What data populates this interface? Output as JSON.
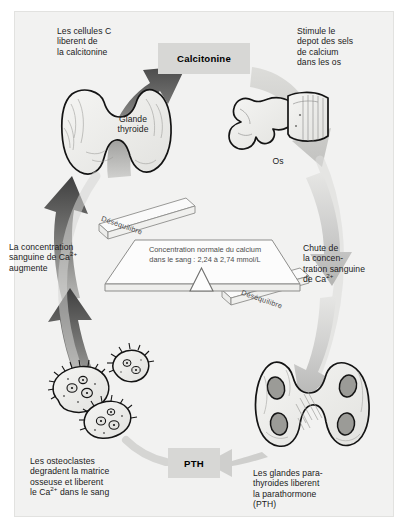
{
  "figure": {
    "background_color": "#f2f2f1",
    "page_color": "#ffffff",
    "accent_box_color": "#d7d7d5",
    "dark_arrow_color": "#4f4f4f",
    "light_arrow_color": "#c9c9c7",
    "organ_fill_color": "#efefed",
    "organ_outline_color": "#1a1a1a"
  },
  "labels": {
    "cellules_c": "Les cellules C\nliberent de\nla calcitonine",
    "cellules_c_display": "Les cellules C libèrent de la calcitonine",
    "stimule": "Stimule le\ndepot des sels\nde calcium\ndans les os",
    "stimule_display": "Stimule le dépôt des sels de calcium dans les os",
    "glande_thyroide": "Glande\nthyroide",
    "glande_thyroide_display": "Glande thyroïde",
    "os": "Os",
    "concentration_augmente": "La concentration\nsanguine de Ca",
    "concentration_augmente_tail": "\naugmente",
    "concentration_augmente_display": "La concentration sanguine de Ca2+ augmente",
    "chute": "Chute de\nla concen-\ntration sanguine\nde Ca",
    "chute_display": "Chute de la concentration sanguine de Ca2+",
    "osteoclastes": "Les osteoclastes\ndegradent la matrice\nosseuse et liberent\nle Ca",
    "osteoclastes_tail": " dans le sang",
    "osteoclastes_display": "Les ostéoclastes dégradent la matrice osseuse et libèrent le Ca2+ dans le sang",
    "parathyroides": "Les glandes para-\nthyroides liberent\nla parathormone\n(PTH)",
    "parathyroides_display": "Les glandes parathyroïdes libèrent la parathormone (PTH)",
    "ion_charge": "2+"
  },
  "hormone_tags": {
    "calcitonine": "Calcitonine",
    "pth": "PTH"
  },
  "balance": {
    "beam_text_line1": "Concentration normale du calcium",
    "beam_text_line2": "dans le sang : 2,24 à 2,74 mmol/L",
    "beam_text_full": "Concentration normale du calcium dans le sang : 2,24 à 2,74 mmol/L",
    "range_min": "2,24",
    "range_max": "2,74",
    "unit": "mmol/L",
    "imbalance_left": "Déséquilibre",
    "imbalance_right": "Déséquilibre"
  },
  "icons": {
    "thyroid": "thyroid-gland-icon",
    "bone": "vertebra-bone-icon",
    "osteoclasts": "osteoclast-cells-icon",
    "parathyroid": "parathyroid-glands-icon",
    "fulcrum": "balance-fulcrum-icon"
  }
}
